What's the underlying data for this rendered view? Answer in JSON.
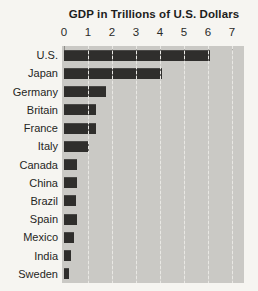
{
  "chart_data": {
    "type": "bar",
    "orientation": "horizontal",
    "title": "GDP in Trillions of U.S. Dollars",
    "categories": [
      "U.S.",
      "Japan",
      "Germany",
      "Britain",
      "France",
      "Italy",
      "Canada",
      "China",
      "Brazil",
      "Spain",
      "Mexico",
      "India",
      "Sweden"
    ],
    "values": [
      6.1,
      4.1,
      1.75,
      1.35,
      1.35,
      1.05,
      0.55,
      0.55,
      0.5,
      0.55,
      0.4,
      0.3,
      0.22
    ],
    "xlabel": "",
    "ylabel": "",
    "xlim": [
      0,
      7.5
    ],
    "x_ticks": [
      0,
      1,
      2,
      3,
      4,
      5,
      6,
      7
    ],
    "x_axis_position": "top",
    "grid": true,
    "legend": false
  },
  "colors": {
    "bar": "#2f2e2c",
    "plot_background": "#cac9c5",
    "gridline": "#e9e8e4",
    "page_background": "#f6f5f1",
    "text": "#252523"
  }
}
